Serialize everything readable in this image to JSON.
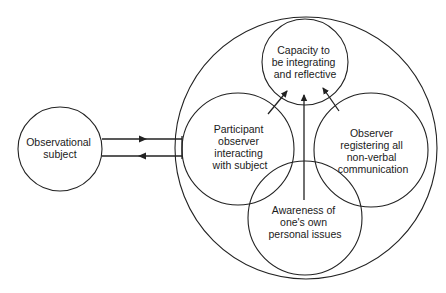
{
  "diagram": {
    "colors": {
      "stroke": "#222222",
      "text": "#1a1a1a",
      "background": "#ffffff"
    },
    "nodes": {
      "observational_subject": {
        "lines": [
          "Observational",
          "subject"
        ]
      },
      "capacity": {
        "lines": [
          "Capacity to",
          "be integrating",
          "and reflective"
        ]
      },
      "participant": {
        "lines": [
          "Participant",
          "observer",
          "interacting",
          "with subject"
        ]
      },
      "observer": {
        "lines": [
          "Observer",
          "registering all",
          "non-verbal",
          "communication"
        ]
      },
      "awareness": {
        "lines": [
          "Awareness of",
          "one's own",
          "personal issues"
        ]
      }
    },
    "edges": [
      {
        "from": "observational_subject",
        "to": "outer_circle",
        "direction": "right"
      },
      {
        "from": "outer_circle",
        "to": "observational_subject",
        "direction": "left"
      },
      {
        "from": "participant",
        "to": "capacity"
      },
      {
        "from": "awareness",
        "to": "capacity"
      },
      {
        "from": "observer",
        "to": "capacity"
      }
    ]
  }
}
